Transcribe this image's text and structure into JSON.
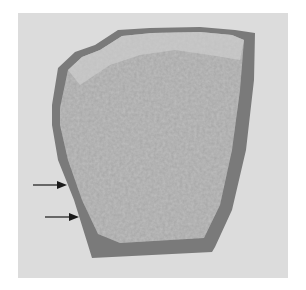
{
  "figure": {
    "colors": {
      "background": "#dcdcdc",
      "rim": "#7a7a7a",
      "interior": "#a8a8a8",
      "interior_light": "#c4c4c4",
      "arrow": "#1a1a1a"
    },
    "annotations": [
      {
        "type": "arrow",
        "direction": "right",
        "icon": "arrow-right-icon",
        "x1": 33,
        "y1": 185,
        "x2": 66,
        "y2": 185
      },
      {
        "type": "arrow",
        "direction": "right",
        "icon": "arrow-right-icon",
        "x1": 45,
        "y1": 217,
        "x2": 78,
        "y2": 217
      }
    ]
  }
}
